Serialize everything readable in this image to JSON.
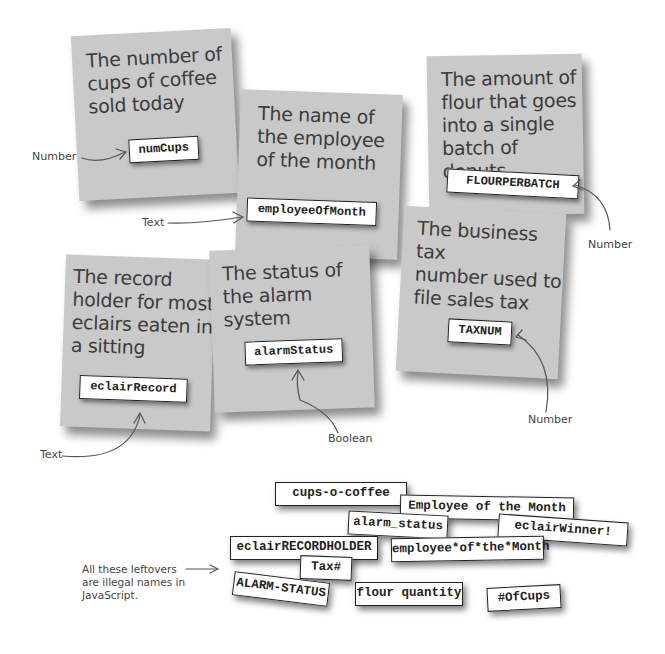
{
  "notes": [
    {
      "id": "coffee",
      "description": "The number of\ncups of coffee\nsold today",
      "variable": "numCups",
      "type_label": "Number"
    },
    {
      "id": "employee",
      "description": "The name of\nthe employee\nof the month",
      "variable": "employeeOfMonth",
      "type_label": "Text"
    },
    {
      "id": "flour",
      "description": "The amount of\nflour that goes\ninto a single\nbatch of donuts",
      "variable": "FLOURPERBATCH",
      "type_label": "Number"
    },
    {
      "id": "tax",
      "description": "The business tax\nnumber used to\nfile sales tax",
      "variable": "TAXNUM",
      "type_label": "Number"
    },
    {
      "id": "eclair",
      "description": "The record\nholder for most\neclairs eaten in\na sitting",
      "variable": "eclairRecord",
      "type_label": "Text"
    },
    {
      "id": "alarm",
      "description": "The status of\nthe alarm system",
      "variable": "alarmStatus",
      "type_label": "Boolean"
    }
  ],
  "leftovers": {
    "caption": "All these leftovers\nare illegal names in\nJavaScript.",
    "items": [
      "cups-o-coffee",
      "Employee of the Month",
      "alarm_status",
      "eclairWinner!",
      "eclairRECORDHOLDER",
      "employee*of*the*Month",
      "Tax#",
      "ALARM-STATUS",
      "flour quantity",
      "#OfCups"
    ]
  },
  "colors": {
    "note_bg": "#c9c9c9",
    "label_bg": "#ffffff",
    "ink": "#3c3c3c"
  }
}
